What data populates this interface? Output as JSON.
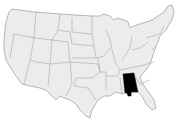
{
  "map": {
    "type": "locator-map",
    "region": "United States",
    "highlighted_state": "Alabama",
    "colors": {
      "state_fill": "#ececec",
      "state_border": "#8a8a8a",
      "highlight_fill": "#000000",
      "background": "#ffffff"
    }
  }
}
